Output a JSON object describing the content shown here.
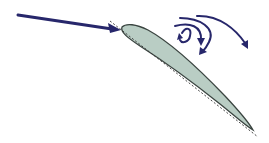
{
  "diagram": {
    "title": "",
    "colors": {
      "background": "#ffffff",
      "arrow": "#27276b",
      "airfoil_fill": "#b9cdc4",
      "airfoil_stroke": "#3a4440",
      "chord_line": "#333333"
    },
    "elements": [
      {
        "id": "incoming-flow-arrow",
        "type": "arrow",
        "label": ""
      },
      {
        "id": "airfoil",
        "type": "shape",
        "label": ""
      },
      {
        "id": "chord-line",
        "type": "dashed-line",
        "label": ""
      },
      {
        "id": "separation-vortex-arrow",
        "type": "curved-arrow",
        "label": ""
      },
      {
        "id": "wake-arrow-1",
        "type": "curved-arrow",
        "label": ""
      },
      {
        "id": "wake-arrow-2",
        "type": "curved-arrow",
        "label": ""
      },
      {
        "id": "wake-arrow-3",
        "type": "curved-arrow",
        "label": ""
      }
    ]
  }
}
